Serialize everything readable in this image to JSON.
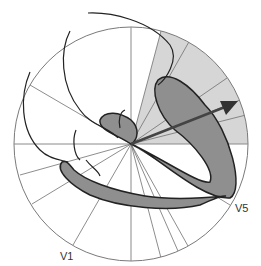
{
  "diagram": {
    "title": "",
    "center": [
      131,
      144
    ],
    "radius": 117,
    "labels": {
      "v1": "V1",
      "v5": "V5"
    },
    "colors": {
      "circle_stroke": "#7a7a7a",
      "axis_stroke": "#8a8a8a",
      "sector_fill": "#d6d6d6",
      "loop_fill": "#8f8f8f",
      "loop_stroke": "#222222",
      "arrow": "#444444",
      "curve_stroke": "#222222"
    },
    "shaded_sector": {
      "from_deg": 0,
      "to_deg": 75,
      "description": "upper-right quadrant highlighted"
    },
    "rays_deg": [
      -15,
      -25,
      -35,
      -60,
      -75,
      -82,
      15,
      22,
      30,
      55,
      75,
      160,
      148,
      200,
      212,
      222,
      240,
      255
    ],
    "arrow": {
      "angle_deg": 18,
      "length": 108
    }
  }
}
